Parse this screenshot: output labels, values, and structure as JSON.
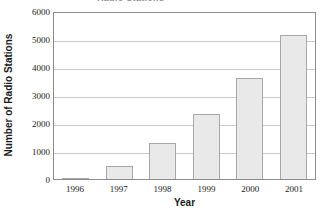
{
  "chart_data": {
    "type": "bar",
    "title": "Radio Stations",
    "title_clipped": true,
    "categories": [
      "1996",
      "1997",
      "1998",
      "1999",
      "2000",
      "2001"
    ],
    "values": [
      50,
      450,
      1270,
      2330,
      3610,
      5160
    ],
    "series": [
      {
        "name": "Number of Radio Stations",
        "values": [
          50,
          450,
          1270,
          2330,
          3610,
          5160
        ]
      }
    ],
    "xlabel": "Year",
    "ylabel": "Number of Radio Stations",
    "ylim": [
      0,
      6000
    ],
    "yticks": [
      0,
      1000,
      2000,
      3000,
      4000,
      5000,
      6000
    ],
    "ytick_labels": [
      "0",
      "1000",
      "2000",
      "3000",
      "4000",
      "5000",
      "6000"
    ],
    "grid": true,
    "grid_axis": "y",
    "legend": false,
    "bar_fill_color": "#e9e9e9",
    "bar_border_color": "#a8a8a8",
    "gridline_color": "#c9c9c9",
    "frame_color": "#8c8c8c"
  }
}
